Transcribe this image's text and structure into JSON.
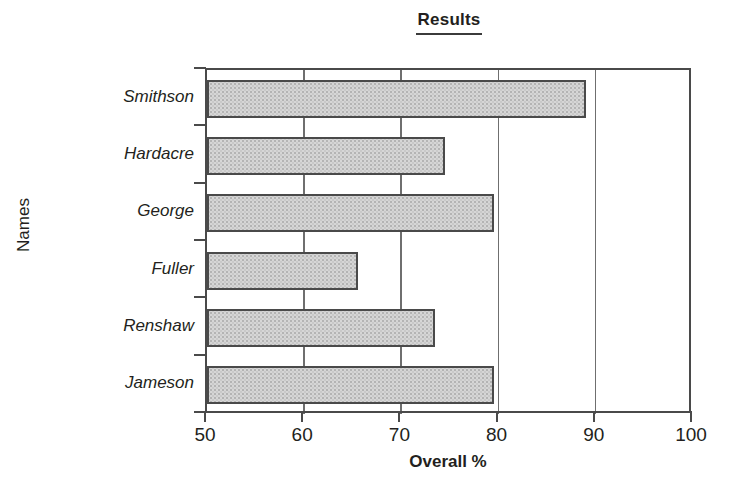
{
  "title": "Results",
  "axis": {
    "x_title": "Overall %",
    "y_title": "Names",
    "x_ticks": [
      "50",
      "60",
      "70",
      "80",
      "90",
      "100"
    ]
  },
  "categories": [
    "Smithson",
    "Hardacre",
    "George",
    "Fuller",
    "Renshaw",
    "Jameson"
  ],
  "colors": {
    "bar_fill": "#d6d6d6",
    "bar_stroke": "#4a4a4a",
    "axis": "#4a4a4a",
    "gridline": "#6f6f6f",
    "text": "#231f20"
  },
  "chart_data": {
    "type": "bar",
    "orientation": "horizontal",
    "title": "Results",
    "xlabel": "Overall %",
    "ylabel": "Names",
    "categories": [
      "Smithson",
      "Hardacre",
      "George",
      "Fuller",
      "Renshaw",
      "Jameson"
    ],
    "values": [
      89,
      74.5,
      79.5,
      65.5,
      73.5,
      79.5
    ],
    "xlim": [
      50,
      100
    ],
    "xticks": [
      50,
      60,
      70,
      80,
      90,
      100
    ],
    "grid": "vertical gridlines at 60, 70, 80, 90",
    "legend": "none"
  }
}
